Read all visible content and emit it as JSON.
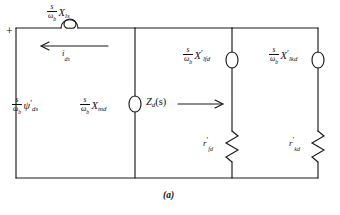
{
  "figure": {
    "caption": "(a)",
    "terminal_plus": "+",
    "description_type": "d-axis operational impedance equivalent circuit"
  },
  "elements": {
    "series_inductor": {
      "name": "stator-leakage-reactance",
      "frac_num": "s",
      "frac_den": "ω",
      "frac_den_sub": "b",
      "symbol": "X",
      "symbol_sub": "ls",
      "prime": "",
      "component": "inductor"
    },
    "current_arrow": {
      "name": "stator-current",
      "symbol": "i",
      "symbol_sub": "ds",
      "direction": "left"
    },
    "source": {
      "name": "flux-linkage-source",
      "frac_num": "s",
      "frac_den": "ω",
      "frac_den_sub": "b",
      "symbol": "ψ",
      "symbol_sub": "ds",
      "prime": "′"
    },
    "magnetizing_inductor": {
      "name": "magnetizing-reactance",
      "frac_num": "s",
      "frac_den": "ω",
      "frac_den_sub": "b",
      "symbol": "X",
      "symbol_sub": "md",
      "prime": "",
      "component": "inductor"
    },
    "impedance_label": {
      "name": "operational-impedance",
      "symbol": "Z",
      "symbol_sub": "d",
      "suffix": "(s)",
      "direction": "right"
    },
    "field_inductor": {
      "name": "field-leakage-reactance",
      "frac_num": "s",
      "frac_den": "ω",
      "frac_den_sub": "b",
      "symbol": "X",
      "symbol_sub": "lfd",
      "prime": "′",
      "component": "inductor"
    },
    "damper_inductor": {
      "name": "damper-leakage-reactance",
      "frac_num": "s",
      "frac_den": "ω",
      "frac_den_sub": "b",
      "symbol": "X",
      "symbol_sub": "lkd",
      "prime": "′",
      "component": "inductor"
    },
    "field_resistor": {
      "name": "field-resistance",
      "symbol": "r",
      "symbol_sub": "fd",
      "prime": "′",
      "component": "resistor"
    },
    "damper_resistor": {
      "name": "damper-resistance",
      "symbol": "r",
      "symbol_sub": "kd",
      "prime": "′",
      "component": "resistor"
    }
  },
  "colors": {
    "line": "#1a1a1a",
    "background": "#ffffff"
  }
}
